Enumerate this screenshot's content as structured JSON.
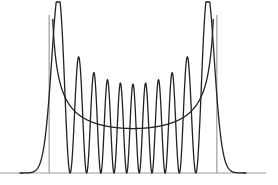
{
  "chart_data": {
    "type": "line",
    "title": "",
    "xlabel": "",
    "ylabel": "",
    "grid": false,
    "legend": null,
    "n": 10,
    "xlim": [
      -6.2,
      6.2
    ],
    "turning_points": [
      -4.583,
      4.583
    ],
    "series": [
      {
        "name": "quantum |psi_10(x)|^2",
        "style": "oscillating",
        "peaks": 11
      },
      {
        "name": "classical density 1/(pi*sqrt(2n+1 - x^2))",
        "style": "U-shaped"
      }
    ],
    "layout": {
      "baseline_y": 173,
      "x_left": 0,
      "x_right": 266,
      "center_x": 133,
      "scale_x": 18.3,
      "scale_y": 640,
      "turning_line_top": 15
    },
    "colors": {
      "curve": "#222222",
      "axis": "#9a9a9a",
      "turning_line": "#8a8a8a"
    }
  }
}
